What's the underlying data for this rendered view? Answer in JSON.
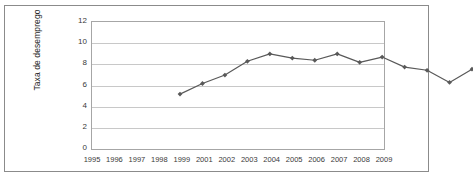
{
  "figure": {
    "background_color": "#ffffff",
    "frame_color": "#8b8b8b"
  },
  "chart_data": {
    "type": "line",
    "title": "",
    "subtitle": "",
    "xlabel": "",
    "ylabel": "Taxa de desemprego",
    "categories": [
      "1995",
      "1996",
      "1997",
      "1998",
      "1999",
      "2001",
      "2002",
      "2003",
      "2004",
      "2005",
      "2006",
      "2007",
      "2008",
      "2009"
    ],
    "values": [
      6.7,
      7.7,
      8.5,
      9.8,
      10.5,
      10.1,
      9.9,
      10.5,
      9.7,
      10.2,
      9.25,
      8.95,
      7.8,
      9.05
    ],
    "series": [
      {
        "name": "Taxa de desemprego",
        "values": [
          6.7,
          7.7,
          8.5,
          9.8,
          10.5,
          10.1,
          9.9,
          10.5,
          9.7,
          10.2,
          9.25,
          8.95,
          7.8,
          9.05
        ],
        "color": "#595959",
        "marker": "diamond",
        "line_width": 1.2
      }
    ],
    "ylim": [
      0,
      12
    ],
    "yticks": [
      0,
      2,
      4,
      6,
      8,
      10,
      12
    ],
    "ytick_labels": [
      "0",
      "2",
      "4",
      "6",
      "8",
      "10",
      "12"
    ],
    "grid": true,
    "grid_axis": "y",
    "grid_color": "#c8c8c8",
    "legend": false,
    "legend_position": "none",
    "plot_border_color": "#a6a6a6",
    "annotations": []
  }
}
